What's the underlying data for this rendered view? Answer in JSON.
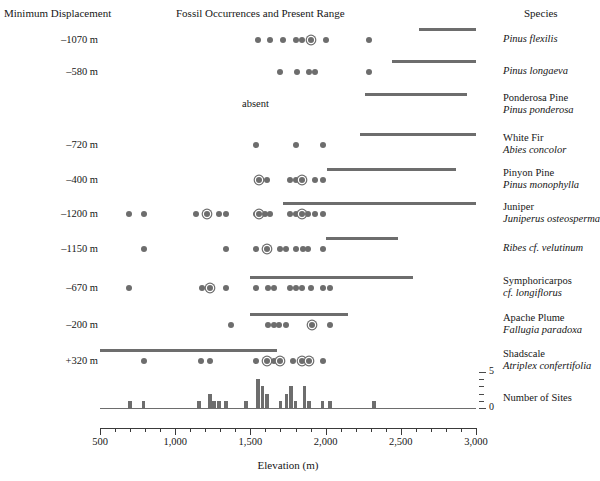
{
  "headers": {
    "left": "Minimum Displacement",
    "middle": "Fossil Occurrences and Present Range",
    "right": "Species"
  },
  "axis": {
    "title": "Elevation (m)",
    "tick_labels": [
      "500",
      "1,000",
      "1,500",
      "2,000",
      "2,500",
      "3,000"
    ],
    "tick_values": [
      500,
      1000,
      1500,
      2000,
      2500,
      3000
    ],
    "minor_step": 100,
    "range": [
      500,
      3000
    ]
  },
  "histogram": {
    "name": "Number of Sites",
    "tick_labels": [
      "0",
      "5"
    ],
    "ylim": [
      0,
      5
    ]
  },
  "absent_label": "absent",
  "rows": [
    {
      "displacement": "–1070 m",
      "common_name": "",
      "latin_name": "Pinus flexilis",
      "present_range": [
        2620,
        3000
      ],
      "absent": false
    },
    {
      "displacement": "–580 m",
      "common_name": "",
      "latin_name": "Pinus longaeva",
      "present_range": [
        2440,
        3000
      ],
      "absent": false
    },
    {
      "displacement": "",
      "common_name": "Ponderosa Pine",
      "latin_name": "Pinus ponderosa",
      "present_range": [
        2260,
        2940
      ],
      "absent": true
    },
    {
      "displacement": "–720 m",
      "common_name": "White Fir",
      "latin_name": "Abies concolor",
      "present_range": [
        2230,
        3000
      ],
      "absent": false
    },
    {
      "displacement": "–400 m",
      "common_name": "Pinyon Pine",
      "latin_name": "Pinus monophylla",
      "present_range": [
        2010,
        2870
      ],
      "absent": false
    },
    {
      "displacement": "–1200 m",
      "common_name": "Juniper",
      "latin_name": "Juniperus osteosperma",
      "present_range": [
        1720,
        3000
      ],
      "absent": false
    },
    {
      "displacement": "–1150 m",
      "common_name": "",
      "latin_name": "Ribes cf. velutinum",
      "present_range": [
        2000,
        2480
      ],
      "absent": false
    },
    {
      "displacement": "–670 m",
      "common_name": "Symphoricarpos",
      "latin_name": "cf. longiflorus",
      "present_range": [
        1500,
        2580
      ],
      "absent": false
    },
    {
      "displacement": "–200 m",
      "common_name": "Apache Plume",
      "latin_name": "Fallugia paradoxa",
      "present_range": [
        1500,
        2150
      ],
      "absent": false
    },
    {
      "displacement": "+320 m",
      "common_name": "Shadscale",
      "latin_name": "Atriplex confertifolia",
      "present_range": [
        500,
        1680
      ],
      "absent": false
    }
  ],
  "chart_data": {
    "type": "scatter",
    "title": "Fossil Occurrences and Present Range",
    "xlabel": "Elevation (m)",
    "ylabel": "Species",
    "xlim": [
      500,
      3000
    ],
    "grid": false,
    "legend": "none",
    "series": [
      {
        "name": "Pinus flexilis",
        "displacement_m": -1070,
        "fossil_elevations": [
          1550,
          1630,
          1720,
          1800,
          1840,
          1900,
          2000,
          2290
        ],
        "circled_elevations": [
          1900
        ],
        "present_range": [
          2620,
          3000
        ]
      },
      {
        "name": "Pinus longaeva",
        "displacement_m": -580,
        "fossil_elevations": [
          1700,
          1810,
          1890,
          1930,
          2290
        ],
        "circled_elevations": [],
        "present_range": [
          2440,
          3000
        ]
      },
      {
        "name": "Pinus ponderosa",
        "displacement_m": null,
        "fossil_elevations": [],
        "circled_elevations": [],
        "present_range": [
          2260,
          2940
        ],
        "note": "absent"
      },
      {
        "name": "Abies concolor",
        "displacement_m": -720,
        "fossil_elevations": [
          1540,
          1800,
          1980
        ],
        "circled_elevations": [],
        "present_range": [
          2230,
          3000
        ]
      },
      {
        "name": "Pinus monophylla",
        "displacement_m": -400,
        "fossil_elevations": [
          1560,
          1610,
          1760,
          1800,
          1840,
          1930,
          1980
        ],
        "circled_elevations": [
          1560,
          1840
        ],
        "present_range": [
          2010,
          2870
        ]
      },
      {
        "name": "Juniperus osteosperma",
        "displacement_m": -1200,
        "fossil_elevations": [
          690,
          790,
          1140,
          1210,
          1290,
          1340,
          1540,
          1560,
          1600,
          1630,
          1760,
          1800,
          1840,
          1880,
          1930,
          1980
        ],
        "circled_elevations": [
          1210,
          1560,
          1840
        ],
        "present_range": [
          1720,
          3000
        ]
      },
      {
        "name": "Ribes cf. velutinum",
        "displacement_m": -1150,
        "fossil_elevations": [
          790,
          1340,
          1540,
          1610,
          1700,
          1740,
          1800,
          1850,
          1880,
          1980
        ],
        "circled_elevations": [
          1610
        ],
        "present_range": [
          2000,
          2480
        ]
      },
      {
        "name": "Symphoricarpos cf. longiflorus",
        "displacement_m": -670,
        "fossil_elevations": [
          690,
          1180,
          1230,
          1340,
          1540,
          1620,
          1660,
          1760,
          1800,
          1840,
          1900,
          1980,
          2030
        ],
        "circled_elevations": [
          1230,
          1810
        ],
        "present_range": [
          1500,
          2580
        ]
      },
      {
        "name": "Fallugia paradoxa",
        "displacement_m": -200,
        "fossil_elevations": [
          1370,
          1620,
          1660,
          1690,
          1740,
          1910,
          2030
        ],
        "circled_elevations": [
          1910
        ],
        "present_range": [
          1500,
          2150
        ]
      },
      {
        "name": "Atriplex confertifolia",
        "displacement_m": 320,
        "fossil_elevations": [
          790,
          1170,
          1230,
          1540,
          1610,
          1660,
          1700,
          1780,
          1840,
          1890,
          1980
        ],
        "circled_elevations": [
          1610,
          1700,
          1840,
          1890
        ],
        "present_range": [
          500,
          1680
        ]
      }
    ],
    "histogram": {
      "type": "bar",
      "ylabel": "Number of Sites",
      "ylim": [
        0,
        5
      ],
      "bin_width": 25,
      "bins": [
        {
          "x": 700,
          "count": 1
        },
        {
          "x": 790,
          "count": 1
        },
        {
          "x": 1160,
          "count": 1
        },
        {
          "x": 1230,
          "count": 2
        },
        {
          "x": 1260,
          "count": 1
        },
        {
          "x": 1290,
          "count": 1
        },
        {
          "x": 1340,
          "count": 1
        },
        {
          "x": 1470,
          "count": 1
        },
        {
          "x": 1550,
          "count": 4
        },
        {
          "x": 1580,
          "count": 3
        },
        {
          "x": 1610,
          "count": 2
        },
        {
          "x": 1700,
          "count": 1
        },
        {
          "x": 1740,
          "count": 2
        },
        {
          "x": 1770,
          "count": 3
        },
        {
          "x": 1800,
          "count": 1
        },
        {
          "x": 1860,
          "count": 3
        },
        {
          "x": 1890,
          "count": 1
        },
        {
          "x": 1980,
          "count": 1
        },
        {
          "x": 2030,
          "count": 1
        },
        {
          "x": 2320,
          "count": 1
        }
      ]
    }
  }
}
